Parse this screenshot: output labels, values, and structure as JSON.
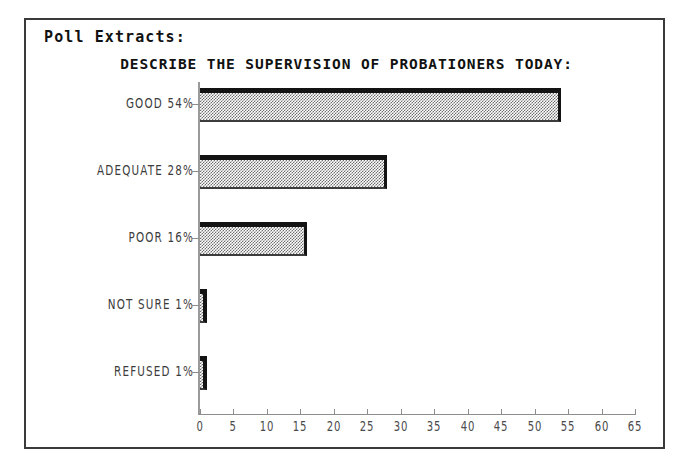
{
  "page": {
    "bleed_text_above_frame": "- .--- .-- -"
  },
  "panel": {
    "header": "Poll Extracts:"
  },
  "chart_data": {
    "type": "bar",
    "orientation": "horizontal",
    "title": "DESCRIBE THE SUPERVISION OF PROBATIONERS TODAY:",
    "xlabel": "",
    "ylabel": "",
    "xlim": [
      0,
      65
    ],
    "xticks": [
      0,
      5,
      10,
      15,
      20,
      25,
      30,
      35,
      40,
      45,
      50,
      55,
      60,
      65
    ],
    "grid": false,
    "legend": null,
    "categories": [
      "GOOD",
      "ADEQUATE",
      "POOR",
      "NOT SURE",
      "REFUSED"
    ],
    "values": [
      54,
      28,
      16,
      1,
      1
    ],
    "value_suffix": "%",
    "bar_labels": [
      "GOOD 54%",
      "ADEQUATE 28%",
      "POOR 16%",
      "NOT SURE 1%",
      "REFUSED 1%"
    ],
    "colors": {
      "bar_fill": "#9c9c9c",
      "bar_edge": "#131313",
      "axis": "#8d8d8d",
      "text": "#3c3c3c",
      "frame": "#3a3a3a",
      "background": "#ffffff"
    }
  }
}
